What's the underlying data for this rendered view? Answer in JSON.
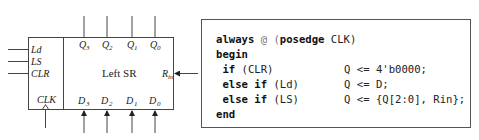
{
  "block": {
    "title": "Left SR",
    "control_inputs": [
      "Ld",
      "LS",
      "CLR"
    ],
    "clock_label": "CLK",
    "serial_input": {
      "base": "R",
      "sub": "in"
    },
    "outputs": [
      {
        "base": "Q",
        "sub": "3"
      },
      {
        "base": "Q",
        "sub": "2"
      },
      {
        "base": "Q",
        "sub": "1"
      },
      {
        "base": "Q",
        "sub": "0"
      }
    ],
    "inputs": [
      {
        "base": "D",
        "sub": "3"
      },
      {
        "base": "D",
        "sub": "2"
      },
      {
        "base": "D",
        "sub": "1"
      },
      {
        "base": "D",
        "sub": "0"
      }
    ]
  },
  "code": {
    "lines": [
      {
        "kw1": "always",
        "at": " @ (",
        "kw2": "posedge",
        "rest": " CLK)",
        "stmt": ""
      },
      {
        "kw1": "begin",
        "at": "",
        "kw2": "",
        "rest": "",
        "stmt": ""
      },
      {
        "kw1": " if",
        "at": "",
        "kw2": "",
        "rest": " (CLR)",
        "stmt": "Q <= 4'b0000;"
      },
      {
        "kw1": " else if",
        "at": "",
        "kw2": "",
        "rest": " (Ld)",
        "stmt": "Q <= D;"
      },
      {
        "kw1": " else if",
        "at": "",
        "kw2": "",
        "rest": " (LS)",
        "stmt": "Q <= {Q[2:0], Rin};"
      },
      {
        "kw1": "end",
        "at": "",
        "kw2": "",
        "rest": "",
        "stmt": ""
      }
    ]
  }
}
